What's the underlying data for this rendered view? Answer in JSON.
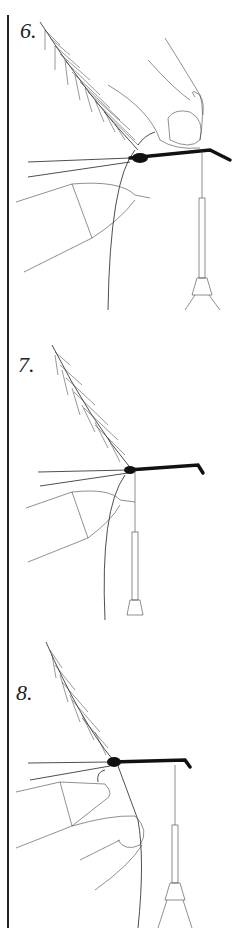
{
  "illustration": {
    "subject": "fly-tying step sequence",
    "steps": [
      {
        "label": "6.",
        "top": 0
      },
      {
        "label": "7.",
        "top": 310
      },
      {
        "label": "8.",
        "top": 620
      }
    ]
  }
}
